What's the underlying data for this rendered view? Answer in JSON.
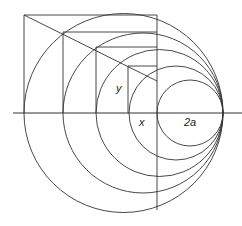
{
  "diagram": {
    "stroke_color": "#333333",
    "labels": {
      "y": "y",
      "x": "x",
      "two_a": "2a"
    },
    "axis": {
      "x1": 13,
      "x2": 242,
      "y": 113
    },
    "tangent_point": {
      "x": 223,
      "y": 113
    },
    "circles": [
      {
        "cx": 123.5,
        "cy": 113,
        "r": 99.5
      },
      {
        "cx": 143,
        "cy": 113,
        "r": 80
      },
      {
        "cx": 159.5,
        "cy": 113,
        "r": 63.5
      },
      {
        "cx": 176,
        "cy": 113,
        "r": 47
      },
      {
        "cx": 190,
        "cy": 113,
        "r": 33
      }
    ]
  }
}
